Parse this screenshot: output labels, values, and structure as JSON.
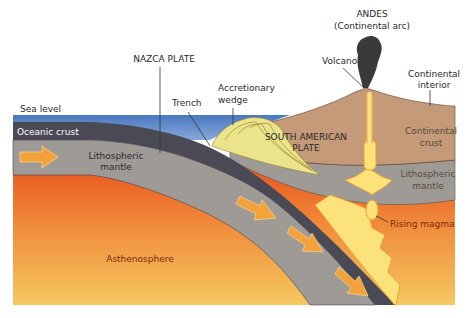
{
  "diagram": {
    "labels": {
      "andes_line1": "ANDES",
      "andes_line2": "(Continental arc)",
      "nazca_plate": "NAZCA PLATE",
      "accretionary_line1": "Accretionary",
      "accretionary_line2": "wedge",
      "trench": "Trench",
      "volcano": "Volcano",
      "continental_interior_line1": "Continental",
      "continental_interior_line2": "interior",
      "sea_level": "Sea level",
      "oceanic_crust": "Oceanic crust",
      "lithospheric_mantle_left_line1": "Lithospheric",
      "lithospheric_mantle_left_line2": "mantle",
      "south_american_line1": "SOUTH AMERICAN",
      "south_american_line2": "PLATE",
      "continental_crust_line1": "Continental",
      "continental_crust_line2": "crust",
      "lithospheric_mantle_right_line1": "Lithospheric",
      "lithospheric_mantle_right_line2": "mantle",
      "rising_magma": "Rising magma",
      "asthenosphere": "Asthenosphere"
    },
    "colors": {
      "ocean": "#4f7fc4",
      "oceanic_crust": "#4a4a55",
      "lithospheric_mantle": "#9e9a96",
      "continental_crust": "#c49a78",
      "asthenosphere_top": "#e8501c",
      "asthenosphere_bottom": "#f5c860",
      "magma": "#fbe27a",
      "magma_edge": "#f0a030",
      "arrow": "#f2a23a",
      "plume": "#3a3a3a",
      "wedge": "#ece48a"
    }
  }
}
